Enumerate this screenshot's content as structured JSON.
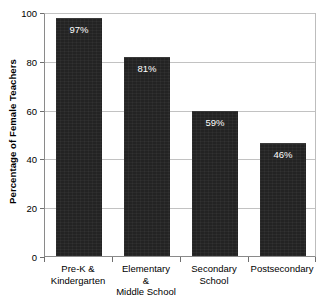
{
  "chart_data": {
    "type": "bar",
    "title": "",
    "xlabel": "",
    "ylabel": "Percentage of Female Teachers",
    "categories": [
      "Pre-K &\nKindergarten",
      "Elementary\n&\nMiddle School",
      "Secondary\nSchool",
      "Postsecondary"
    ],
    "category_lines": [
      [
        "Pre-K &",
        "Kindergarten"
      ],
      [
        "Elementary",
        "&",
        "Middle School"
      ],
      [
        "Secondary",
        "School"
      ],
      [
        "Postsecondary"
      ]
    ],
    "values": [
      97,
      81,
      59,
      46
    ],
    "value_labels": [
      "97%",
      "81%",
      "59%",
      "46%"
    ],
    "ylim": [
      0,
      100
    ],
    "yticks": [
      0,
      20,
      40,
      60,
      80,
      100
    ],
    "ytick_labels": [
      "0",
      "20",
      "40",
      "60",
      "80",
      "100"
    ],
    "grid": true,
    "legend": "none",
    "colors": {
      "bar": "#232323",
      "value_label": "#ffffff",
      "gridline": "#c2c2c2",
      "axis": "#8a8a8a",
      "background": "#ffffff",
      "text": "#000000"
    }
  }
}
